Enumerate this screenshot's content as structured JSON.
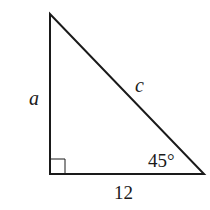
{
  "diagram": {
    "type": "right-triangle",
    "labels": {
      "vertical_side": "a",
      "hypotenuse": "c",
      "base": "12",
      "angle": "45°"
    },
    "right_angle_marker": true,
    "colors": {
      "stroke": "#1a1a1a",
      "background": "#ffffff"
    }
  }
}
